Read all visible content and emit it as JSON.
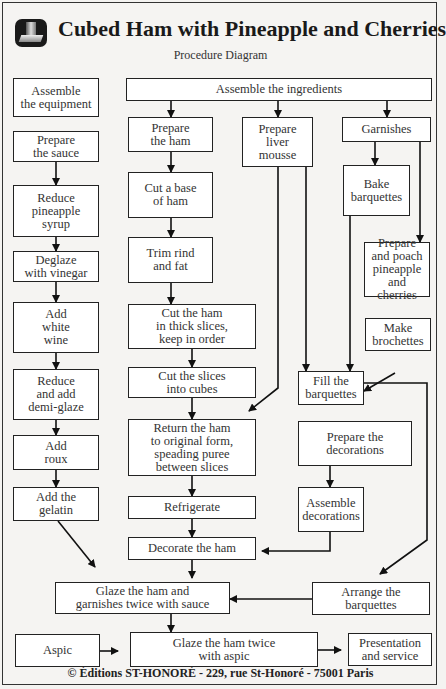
{
  "header": {
    "logo_icon": "chef-hat-logo-icon",
    "title": "Cubed Ham with Pineapple and Cherries",
    "subtitle": "Procedure Diagram"
  },
  "steps": {
    "assemble_equipment": "Assemble\nthe equipment",
    "assemble_ingredients": "Assemble the ingredients",
    "prepare_sauce": "Prepare\nthe sauce",
    "reduce_syrup": "Reduce\npineapple\nsyrup",
    "deglaze": "Deglaze\nwith vinegar",
    "add_wine": "Add\nwhite\nwine",
    "reduce_demiglaze": "Reduce\nand add\ndemi-glaze",
    "add_roux": "Add\nroux",
    "add_gelatin": "Add the\ngelatin",
    "prepare_ham": "Prepare\nthe ham",
    "cut_base": "Cut a base\nof ham",
    "trim_rind": "Trim rind\nand fat",
    "cut_slices": "Cut the ham\nin thick slices,\nkeep in order",
    "cut_cubes": "Cut the slices\ninto cubes",
    "return_form": "Return the ham\nto original form,\nspeading puree\nbetween slices",
    "refrigerate": "Refrigerate",
    "decorate_ham": "Decorate the ham",
    "prepare_mousse": "Prepare\nliver\nmousse",
    "garnishes": "Garnishes",
    "bake_barquettes": "Bake\nbarquettes",
    "poach_fruit": "Prepare\nand poach\npineapple\nand cherries",
    "make_brochettes": "Make\nbrochettes",
    "fill_barquettes": "Fill the\nbarquettes",
    "prepare_decorations": "Prepare the\ndecorations",
    "assemble_decorations": "Assemble\ndecorations",
    "arrange_barquettes": "Arrange the\nbarquettes",
    "glaze_sauce": "Glaze the ham and\ngarnishes twice with sauce",
    "aspic": "Aspic",
    "glaze_aspic": "Glaze the ham twice\nwith aspic",
    "presentation": "Presentation\nand service"
  },
  "footer": {
    "copyright": "© Éditions ST-HONORÉ - 229, rue St-Honoré - 75001 Paris"
  }
}
